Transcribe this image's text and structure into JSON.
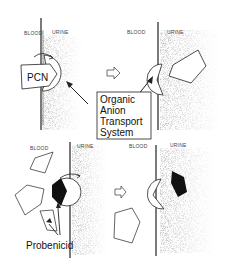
{
  "panels": [
    {
      "id": "top-left",
      "blood_label": "BLOOD",
      "urine_label": "URINE",
      "substrate_label": "PCN"
    },
    {
      "id": "top-right",
      "blood_label": "BLOOD",
      "urine_label": "URINE"
    },
    {
      "id": "bottom-left",
      "blood_label": "BLOOD",
      "urine_label": "URINE"
    },
    {
      "id": "bottom-right",
      "blood_label": "BLOOD",
      "urine_label": "URINE"
    }
  ],
  "callout": {
    "lines": [
      "Organic",
      "Anion",
      "Transport",
      "System"
    ]
  },
  "inhibitor_label": "Probenicid",
  "colors": {
    "ink": "#222222",
    "filled": "#111111",
    "stipple": "#bdbdbd",
    "background": "#ffffff"
  }
}
